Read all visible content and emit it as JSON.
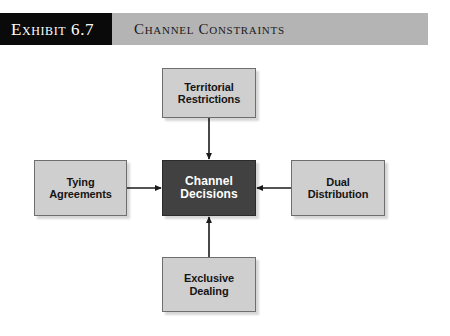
{
  "header": {
    "exhibit_label": "Exhibit 6.7",
    "title": "Channel Constraints",
    "tag_background": "#0a0a0a",
    "tag_text_color": "#ffffff",
    "band_background": "#b4b4b4",
    "band_text_color": "#1a1a1a"
  },
  "diagram": {
    "type": "hub-and-spoke",
    "arrow_direction": "satellites-point-to-center",
    "center": {
      "id": "channel-decisions",
      "line1": "Channel",
      "line2": "Decisions",
      "background": "#414141",
      "text_color": "#ffffff"
    },
    "satellites": [
      {
        "id": "territorial-restrictions",
        "position": "top",
        "line1": "Territorial",
        "line2": "Restrictions",
        "background": "#cfcfcf",
        "text_color": "#151515"
      },
      {
        "id": "tying-agreements",
        "position": "left",
        "line1": "Tying",
        "line2": "Agreements",
        "background": "#cfcfcf",
        "text_color": "#151515"
      },
      {
        "id": "dual-distribution",
        "position": "right",
        "line1": "Dual",
        "line2": "Distribution",
        "background": "#cfcfcf",
        "text_color": "#151515"
      },
      {
        "id": "exclusive-dealing",
        "position": "bottom",
        "line1": "Exclusive",
        "line2": "Dealing",
        "background": "#cfcfcf",
        "text_color": "#151515"
      }
    ],
    "connector_color": "#1a1a1a"
  }
}
